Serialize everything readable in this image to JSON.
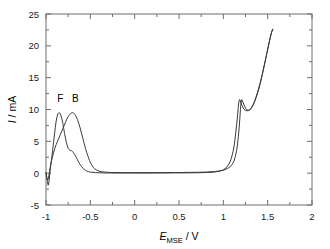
{
  "chart_data": {
    "type": "line",
    "title": "",
    "xlabel": "E_MSE / V",
    "xlabel_parts": {
      "symbol": "E",
      "subscript": "MSE",
      "unit": "V",
      "separator": "/"
    },
    "ylabel": "I / mA",
    "ylabel_parts": {
      "symbol": "I",
      "unit": "mA",
      "separator": "/"
    },
    "xlim": [
      -1,
      2
    ],
    "ylim": [
      -5,
      25
    ],
    "xticks": [
      -1,
      -0.5,
      0,
      0.5,
      1,
      1.5,
      2
    ],
    "xtick_labels": [
      "-1",
      "-0.5",
      "0",
      "0.5",
      "1",
      "1.5",
      "2"
    ],
    "yticks": [
      -5,
      0,
      5,
      10,
      15,
      20,
      25
    ],
    "ytick_labels": [
      "-5",
      "0",
      "5",
      "10",
      "15",
      "20",
      "25"
    ],
    "minor_xticks": [
      -0.75,
      -0.25,
      0.25,
      0.75,
      1.25,
      1.75
    ],
    "minor_yticks": [
      -2.5,
      2.5,
      7.5,
      12.5,
      17.5,
      22.5
    ],
    "grid": false,
    "legend": "none",
    "annotations": [
      {
        "text": "F",
        "x": -0.84,
        "y": 11.2
      },
      {
        "text": "B",
        "x": -0.67,
        "y": 11.2
      }
    ],
    "colors": {
      "line": "#3a3a3a",
      "frame": "#6e6e6e",
      "text": "#000000"
    },
    "series": [
      {
        "name": "F",
        "comment": "forward sweep: anodic peak near -0.85 V",
        "points": [
          [
            -1.0,
            0.1
          ],
          [
            -0.985,
            -1.3
          ],
          [
            -0.975,
            -1.9
          ],
          [
            -0.965,
            -1.2
          ],
          [
            -0.955,
            0.2
          ],
          [
            -0.945,
            1.4
          ],
          [
            -0.935,
            2.5
          ],
          [
            -0.925,
            3.6
          ],
          [
            -0.915,
            4.8
          ],
          [
            -0.905,
            6.0
          ],
          [
            -0.895,
            7.2
          ],
          [
            -0.885,
            8.2
          ],
          [
            -0.875,
            8.9
          ],
          [
            -0.865,
            9.35
          ],
          [
            -0.855,
            9.5
          ],
          [
            -0.845,
            9.45
          ],
          [
            -0.835,
            9.2
          ],
          [
            -0.822,
            8.6
          ],
          [
            -0.81,
            7.8
          ],
          [
            -0.8,
            7.0
          ],
          [
            -0.79,
            6.2
          ],
          [
            -0.78,
            5.5
          ],
          [
            -0.77,
            4.8
          ],
          [
            -0.76,
            4.3
          ],
          [
            -0.75,
            3.9
          ],
          [
            -0.74,
            3.7
          ],
          [
            -0.73,
            3.6
          ],
          [
            -0.72,
            3.55
          ],
          [
            -0.71,
            3.5
          ],
          [
            -0.7,
            3.4
          ],
          [
            -0.69,
            3.2
          ],
          [
            -0.675,
            2.9
          ],
          [
            -0.66,
            2.5
          ],
          [
            -0.645,
            2.1
          ],
          [
            -0.63,
            1.7
          ],
          [
            -0.615,
            1.35
          ],
          [
            -0.6,
            1.05
          ],
          [
            -0.585,
            0.8
          ],
          [
            -0.57,
            0.6
          ],
          [
            -0.555,
            0.45
          ],
          [
            -0.54,
            0.33
          ],
          [
            -0.52,
            0.24
          ],
          [
            -0.5,
            0.17
          ],
          [
            -0.47,
            0.12
          ],
          [
            -0.44,
            0.09
          ],
          [
            -0.4,
            0.06
          ],
          [
            -0.35,
            0.04
          ],
          [
            -0.3,
            0.03
          ],
          [
            -0.2,
            0.02
          ],
          [
            -0.1,
            0.02
          ],
          [
            0.0,
            0.02
          ],
          [
            0.15,
            0.02
          ],
          [
            0.3,
            0.03
          ],
          [
            0.45,
            0.04
          ],
          [
            0.6,
            0.05
          ],
          [
            0.72,
            0.07
          ],
          [
            0.82,
            0.11
          ],
          [
            0.9,
            0.18
          ],
          [
            0.96,
            0.32
          ],
          [
            1.0,
            0.52
          ],
          [
            1.04,
            0.95
          ],
          [
            1.07,
            1.6
          ],
          [
            1.09,
            2.3
          ],
          [
            1.11,
            3.4
          ],
          [
            1.125,
            4.6
          ],
          [
            1.14,
            6.3
          ],
          [
            1.15,
            7.6
          ],
          [
            1.16,
            9.0
          ],
          [
            1.168,
            10.3
          ],
          [
            1.175,
            11.2
          ],
          [
            1.182,
            11.55
          ],
          [
            1.19,
            11.4
          ],
          [
            1.2,
            11.0
          ],
          [
            1.215,
            10.5
          ],
          [
            1.23,
            10.1
          ],
          [
            1.25,
            9.85
          ],
          [
            1.27,
            9.8
          ],
          [
            1.29,
            9.9
          ],
          [
            1.31,
            10.15
          ],
          [
            1.33,
            10.6
          ],
          [
            1.35,
            11.2
          ],
          [
            1.37,
            12.0
          ],
          [
            1.39,
            12.9
          ],
          [
            1.41,
            13.9
          ],
          [
            1.43,
            15.0
          ],
          [
            1.45,
            16.2
          ],
          [
            1.47,
            17.5
          ],
          [
            1.49,
            18.8
          ],
          [
            1.51,
            20.1
          ],
          [
            1.53,
            21.4
          ],
          [
            1.545,
            22.2
          ],
          [
            1.56,
            22.6
          ]
        ]
      },
      {
        "name": "B",
        "comment": "backward sweep: anodic peak near -0.70 V",
        "points": [
          [
            -1.0,
            0.0
          ],
          [
            -0.99,
            -0.7
          ],
          [
            -0.98,
            -1.1
          ],
          [
            -0.97,
            -0.6
          ],
          [
            -0.96,
            0.3
          ],
          [
            -0.95,
            1.1
          ],
          [
            -0.94,
            1.8
          ],
          [
            -0.93,
            2.4
          ],
          [
            -0.915,
            3.2
          ],
          [
            -0.9,
            3.9
          ],
          [
            -0.885,
            4.5
          ],
          [
            -0.87,
            5.0
          ],
          [
            -0.855,
            5.5
          ],
          [
            -0.84,
            6.0
          ],
          [
            -0.825,
            6.5
          ],
          [
            -0.81,
            7.0
          ],
          [
            -0.795,
            7.5
          ],
          [
            -0.78,
            8.0
          ],
          [
            -0.765,
            8.5
          ],
          [
            -0.75,
            8.9
          ],
          [
            -0.735,
            9.2
          ],
          [
            -0.72,
            9.4
          ],
          [
            -0.705,
            9.5
          ],
          [
            -0.69,
            9.45
          ],
          [
            -0.675,
            9.25
          ],
          [
            -0.66,
            8.9
          ],
          [
            -0.645,
            8.4
          ],
          [
            -0.63,
            7.8
          ],
          [
            -0.615,
            7.1
          ],
          [
            -0.6,
            6.3
          ],
          [
            -0.585,
            5.5
          ],
          [
            -0.57,
            4.7
          ],
          [
            -0.555,
            3.9
          ],
          [
            -0.54,
            3.2
          ],
          [
            -0.525,
            2.6
          ],
          [
            -0.51,
            2.0
          ],
          [
            -0.495,
            1.55
          ],
          [
            -0.48,
            1.2
          ],
          [
            -0.465,
            0.9
          ],
          [
            -0.45,
            0.68
          ],
          [
            -0.43,
            0.5
          ],
          [
            -0.41,
            0.36
          ],
          [
            -0.39,
            0.27
          ],
          [
            -0.36,
            0.2
          ],
          [
            -0.32,
            0.15
          ],
          [
            -0.27,
            0.11
          ],
          [
            -0.2,
            0.09
          ],
          [
            -0.1,
            0.08
          ],
          [
            0.0,
            0.08
          ],
          [
            0.15,
            0.08
          ],
          [
            0.3,
            0.09
          ],
          [
            0.45,
            0.1
          ],
          [
            0.6,
            0.12
          ],
          [
            0.72,
            0.14
          ],
          [
            0.82,
            0.18
          ],
          [
            0.9,
            0.25
          ],
          [
            0.96,
            0.35
          ],
          [
            1.01,
            0.5
          ],
          [
            1.05,
            0.75
          ],
          [
            1.08,
            1.05
          ],
          [
            1.1,
            1.4
          ],
          [
            1.12,
            1.9
          ],
          [
            1.135,
            2.6
          ],
          [
            1.15,
            3.6
          ],
          [
            1.16,
            4.6
          ],
          [
            1.17,
            5.8
          ],
          [
            1.178,
            7.1
          ],
          [
            1.186,
            8.6
          ],
          [
            1.193,
            10.0
          ],
          [
            1.2,
            11.1
          ],
          [
            1.206,
            11.55
          ],
          [
            1.212,
            11.5
          ],
          [
            1.22,
            11.2
          ],
          [
            1.235,
            10.7
          ],
          [
            1.25,
            10.2
          ],
          [
            1.265,
            9.95
          ],
          [
            1.28,
            9.85
          ],
          [
            1.3,
            9.95
          ],
          [
            1.32,
            10.3
          ],
          [
            1.34,
            10.8
          ],
          [
            1.36,
            11.5
          ],
          [
            1.38,
            12.3
          ],
          [
            1.4,
            13.2
          ],
          [
            1.42,
            14.3
          ],
          [
            1.44,
            15.5
          ],
          [
            1.46,
            16.8
          ],
          [
            1.48,
            18.1
          ],
          [
            1.5,
            19.4
          ],
          [
            1.52,
            20.7
          ],
          [
            1.54,
            21.9
          ],
          [
            1.555,
            22.6
          ]
        ]
      }
    ]
  },
  "plot_geometry": {
    "left": 46,
    "right": 312,
    "top": 14,
    "bottom": 205
  }
}
